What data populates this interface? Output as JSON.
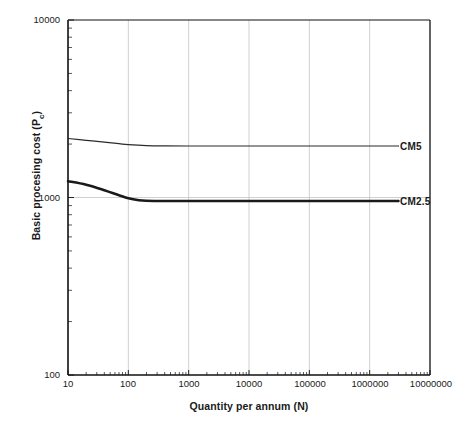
{
  "chart_data": {
    "type": "line",
    "title": "",
    "xlabel": "Quantity per annum (N)",
    "ylabel": "Basic procesing cost (Pc)",
    "ylabel_main": "Basic procesing cost (P",
    "ylabel_sub": "c",
    "ylabel_tail": ")",
    "xscale": "log",
    "yscale": "log",
    "xlim": [
      10,
      10000000
    ],
    "ylim": [
      100,
      10000
    ],
    "grid": "major vertical decades and horizontal decades",
    "legend_position": "inline labels at right end of each curve",
    "xticks": [
      "10",
      "100",
      "1000",
      "10000",
      "100000",
      "1000000",
      "10000000"
    ],
    "xtick_values": [
      10,
      100,
      1000,
      10000,
      100000,
      1000000,
      10000000
    ],
    "yticks": [
      "100",
      "1000",
      "10000"
    ],
    "ytick_values": [
      100,
      1000,
      10000
    ],
    "series": [
      {
        "name": "CM5",
        "label": "CM5",
        "color": "#2b2b2b",
        "linewidth": 1.2,
        "x": [
          10,
          20,
          40,
          70,
          100,
          200,
          400,
          1000,
          4000,
          10000,
          100000,
          1000000,
          3000000
        ],
        "values": [
          2150,
          2100,
          2050,
          2010,
          1985,
          1960,
          1952,
          1950,
          1950,
          1950,
          1950,
          1950,
          1950
        ]
      },
      {
        "name": "CM2.5",
        "label": "CM2.5",
        "color": "#1a1a1a",
        "linewidth": 2.6,
        "x": [
          10,
          20,
          40,
          70,
          100,
          150,
          200,
          400,
          1000,
          4000,
          10000,
          100000,
          1000000,
          3000000
        ],
        "values": [
          1235,
          1180,
          1100,
          1030,
          990,
          965,
          958,
          955,
          955,
          955,
          955,
          955,
          955,
          955
        ]
      }
    ],
    "annotations": [
      {
        "text": "CM5",
        "x_px": 400,
        "y_px": 147
      },
      {
        "text": "CM2.5",
        "x_px": 400,
        "y_px": 202
      }
    ]
  },
  "axes": {
    "frame_color": "#111111",
    "grid_color": "#bdbdbd"
  }
}
